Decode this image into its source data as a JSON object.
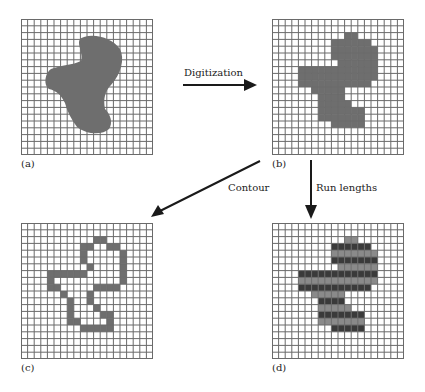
{
  "figure": {
    "grid": {
      "cols": 20,
      "rows": 20,
      "line_color": "#6a6a6a",
      "fill_color": "#6e6e6e",
      "run_dark_color": "#3a3a3a"
    },
    "panels": [
      {
        "id": "a",
        "label": "(a)",
        "caption": "Original continuous shape on grid"
      },
      {
        "id": "b",
        "label": "(b)",
        "caption": "Digitized shape"
      },
      {
        "id": "c",
        "label": "(c)",
        "caption": "Contour"
      },
      {
        "id": "d",
        "label": "(d)",
        "caption": "Run lengths"
      }
    ],
    "arrows": [
      {
        "label": "Digitization",
        "from": "a",
        "to": "b"
      },
      {
        "label": "Contour",
        "from": "b",
        "to": "c"
      },
      {
        "label": "Run lengths",
        "from": "b",
        "to": "d"
      }
    ],
    "digitized_runs": [
      {
        "row": 2,
        "start": 11,
        "end": 12
      },
      {
        "row": 3,
        "start": 9,
        "end": 14
      },
      {
        "row": 4,
        "start": 9,
        "end": 15
      },
      {
        "row": 5,
        "start": 9,
        "end": 15
      },
      {
        "row": 6,
        "start": 10,
        "end": 15
      },
      {
        "row": 7,
        "start": 4,
        "end": 15
      },
      {
        "row": 8,
        "start": 4,
        "end": 15
      },
      {
        "row": 9,
        "start": 4,
        "end": 14
      },
      {
        "row": 10,
        "start": 6,
        "end": 10
      },
      {
        "row": 11,
        "start": 7,
        "end": 10
      },
      {
        "row": 12,
        "start": 7,
        "end": 11
      },
      {
        "row": 13,
        "start": 7,
        "end": 13
      },
      {
        "row": 14,
        "start": 7,
        "end": 13
      },
      {
        "row": 15,
        "start": 9,
        "end": 13
      }
    ],
    "run_length_dark_rows": [
      3,
      5,
      7,
      9,
      11,
      13,
      15
    ]
  }
}
